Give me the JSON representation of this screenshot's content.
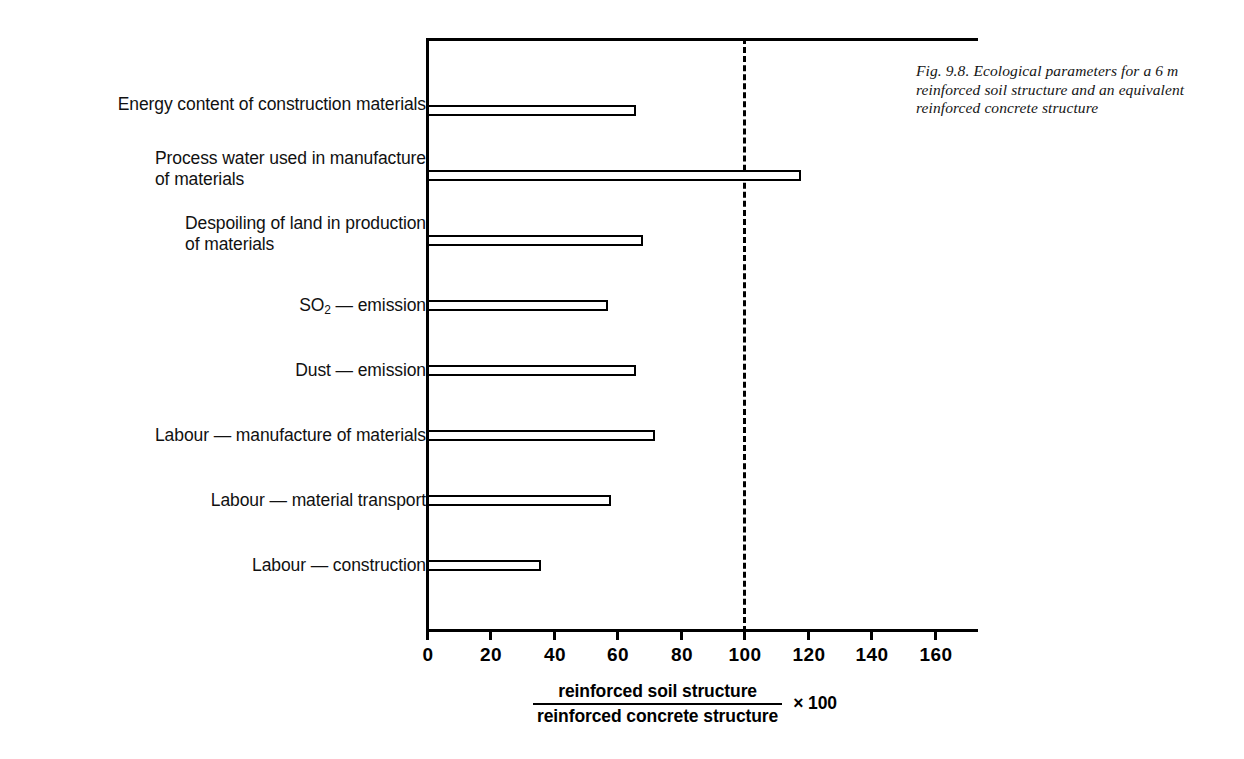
{
  "caption": "Fig. 9.8. Ecological parameters for a 6 m reinforced soil structure and an equivalent reinforced concrete structure",
  "axis_title": {
    "numerator": "reinforced soil structure",
    "denominator": "reinforced concrete structure",
    "multiplier": "× 100"
  },
  "chart_data": {
    "type": "bar",
    "orientation": "horizontal",
    "title": "",
    "xlabel": "reinforced soil structure / reinforced concrete structure × 100",
    "ylabel": "",
    "xlim": [
      0,
      174
    ],
    "xticks": [
      0,
      20,
      40,
      60,
      80,
      100,
      120,
      140,
      160
    ],
    "xticklabels": [
      "0",
      "20",
      "40",
      "60",
      "80",
      "100",
      "120",
      "140",
      "160"
    ],
    "grid": false,
    "legend": null,
    "reference_line": {
      "value": 100,
      "style": "dashed"
    },
    "categories": [
      "Energy content of construction materials",
      "Process water used in manufacture\nof materials",
      "Despoiling of land in production\nof materials",
      "SO2 — emission",
      "Dust — emission",
      "Labour — manufacture of materials",
      "Labour — material transport",
      "Labour — construction"
    ],
    "values": [
      66,
      118,
      68,
      57,
      66,
      72,
      58,
      36
    ]
  }
}
